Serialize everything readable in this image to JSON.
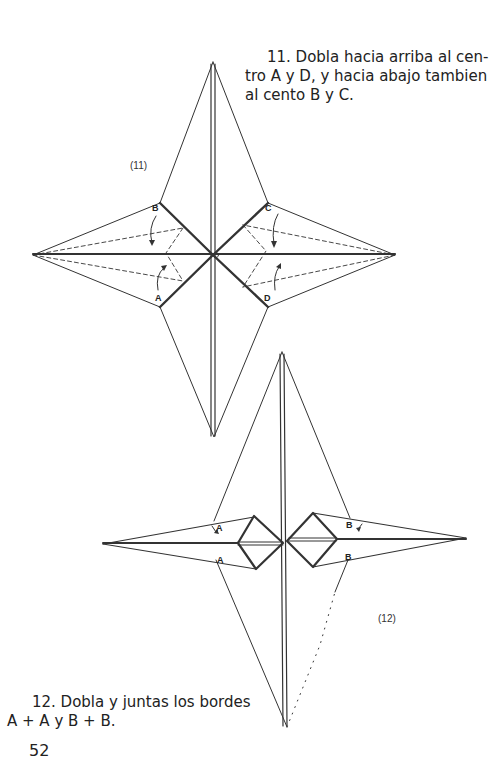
{
  "step11": {
    "line1": "11. Dobla hacia arriba al cen-",
    "line2": "tro A y D, y hacia abajo tambien",
    "line3": "al cento B y C."
  },
  "step12": {
    "line1": "12. Dobla y juntas los bordes",
    "line2": "A + A y B + B."
  },
  "page_number": "52",
  "figures": {
    "fig11": {
      "label": "(11)",
      "points": {
        "A": "A",
        "B": "B",
        "C": "C",
        "D": "D"
      }
    },
    "fig12": {
      "label": "(12)",
      "points": {
        "A_top": "A",
        "A_bottom": "A",
        "B_top": "B",
        "B_bottom": "B"
      }
    }
  },
  "colors": {
    "line": "#333333",
    "background": "#ffffff"
  }
}
